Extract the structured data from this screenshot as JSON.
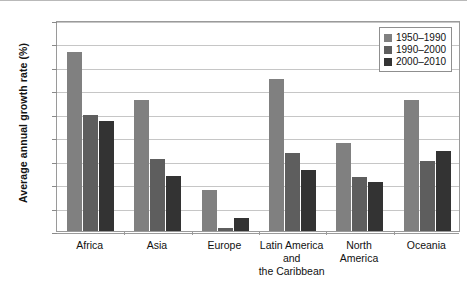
{
  "chart_data": {
    "type": "bar",
    "title": "",
    "xlabel": "",
    "ylabel": "Average annual growth rate (%)",
    "categories": [
      "Africa",
      "Asia",
      "Europe",
      "Latin America\nand\nthe Caribbean",
      "North\nAmerica",
      "Oceania"
    ],
    "series": [
      {
        "name": "1950–1990",
        "color": "#808080",
        "values": [
          3.81,
          2.79,
          0.87,
          3.25,
          1.88,
          2.79
        ]
      },
      {
        "name": "1990–2000",
        "color": "#5e5e5e",
        "values": [
          2.47,
          1.53,
          0.06,
          1.67,
          1.15,
          1.5
        ]
      },
      {
        "name": "2000–2010",
        "color": "#333333",
        "values": [
          2.35,
          1.18,
          0.28,
          1.3,
          1.05,
          1.7
        ]
      }
    ],
    "ylim": [
      0,
      4.5
    ],
    "ytick_values": [
      0,
      0.5,
      1,
      1.5,
      2,
      2.5,
      3,
      3.5,
      4,
      4.5
    ],
    "ytick_labels": [
      "0",
      "0.5",
      "1",
      "1.5",
      "2",
      "2.5",
      "3",
      "3.5",
      "4",
      "4.5"
    ],
    "grid": true,
    "legend_position": "top-right",
    "bar_group_gap": true
  },
  "legend": {
    "entries": [
      {
        "label": "1950–1990",
        "color": "#808080"
      },
      {
        "label": "1990–2000",
        "color": "#5e5e5e"
      },
      {
        "label": "2000–2010",
        "color": "#333333"
      }
    ]
  }
}
